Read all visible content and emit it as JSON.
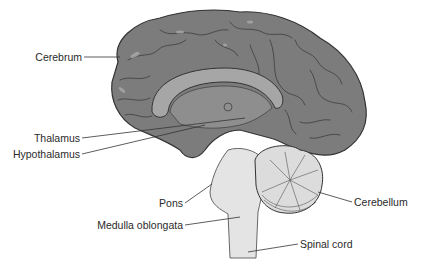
{
  "diagram": {
    "colors": {
      "background": "#ffffff",
      "cortex": "#7c7c7c",
      "cortex_dark": "#5e5e5e",
      "gyri_highlight": "#a9a9a9",
      "inner_light": "#9a9a9a",
      "corpus_callosum": "#a6a6a6",
      "brainstem": "#e4e4e4",
      "cerebellum": "#dcdcdc",
      "outline": "#333333",
      "leader_line": "#333333",
      "text": "#2a2a2a"
    },
    "labels": [
      {
        "id": "cerebrum",
        "text": "Cerebrum"
      },
      {
        "id": "thalamus",
        "text": "Thalamus"
      },
      {
        "id": "hypothalamus",
        "text": "Hypothalamus"
      },
      {
        "id": "pons",
        "text": "Pons"
      },
      {
        "id": "medulla",
        "text": "Medulla oblongata"
      },
      {
        "id": "cerebellum",
        "text": "Cerebellum"
      },
      {
        "id": "spinal_cord",
        "text": "Spinal cord"
      }
    ]
  }
}
